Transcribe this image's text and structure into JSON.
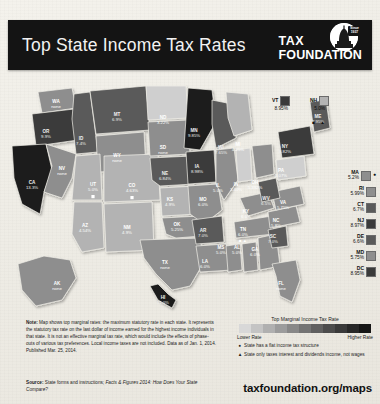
{
  "header": {
    "title": "Top State Income Tax Rates",
    "logo_line1": "TAX",
    "logo_line2": "FOUNDATION",
    "logo_seal_line1": "Since",
    "logo_seal_line2": "1937"
  },
  "chart_data": {
    "type": "heatmap",
    "title": "Top State Income Tax Rates",
    "legend_title": "Top Marginal Income Tax Rate",
    "legend_low": "Lower Rate",
    "legend_high": "Higher Rate",
    "categories": [
      "AL",
      "AK",
      "AZ",
      "AR",
      "CA",
      "CO",
      "CT",
      "DE",
      "DC",
      "FL",
      "GA",
      "HI",
      "ID",
      "IL",
      "IN",
      "IA",
      "KS",
      "KY",
      "LA",
      "ME",
      "MD",
      "MA",
      "MI",
      "MN",
      "MS",
      "MO",
      "MT",
      "NE",
      "NV",
      "NH",
      "NJ",
      "NM",
      "NY",
      "NC",
      "ND",
      "OH",
      "OK",
      "OR",
      "PA",
      "RI",
      "SC",
      "SD",
      "TN",
      "TX",
      "UT",
      "VT",
      "VA",
      "WA",
      "WV",
      "WI",
      "WY"
    ],
    "values": [
      5.0,
      0,
      4.54,
      7.0,
      13.3,
      4.63,
      6.7,
      6.6,
      8.95,
      0,
      6.0,
      11.0,
      7.4,
      5.0,
      3.4,
      8.98,
      4.9,
      6.0,
      6.0,
      7.95,
      5.75,
      5.2,
      4.25,
      9.85,
      5.0,
      6.0,
      6.9,
      6.84,
      0,
      5.0,
      8.97,
      4.9,
      8.82,
      5.8,
      3.22,
      5.392,
      5.25,
      9.9,
      3.07,
      5.99,
      7.0,
      0,
      6.0,
      0,
      5.0,
      8.95,
      5.75,
      0,
      6.5,
      7.65,
      0
    ],
    "states": [
      {
        "abbr": "WA",
        "rate": "none",
        "x": 56,
        "y": 29,
        "shade": "mid"
      },
      {
        "abbr": "OR",
        "rate": "9.9%",
        "x": 46,
        "y": 59,
        "shade": "vdark"
      },
      {
        "abbr": "CA",
        "rate": "13.3%",
        "x": 32,
        "y": 110,
        "shade": "black"
      },
      {
        "abbr": "ID",
        "rate": "7.4%",
        "x": 81,
        "y": 66,
        "shade": "dark"
      },
      {
        "abbr": "NV",
        "rate": "none",
        "x": 62,
        "y": 96,
        "shade": "mid"
      },
      {
        "abbr": "MT",
        "rate": "6.9%",
        "x": 117,
        "y": 42,
        "shade": "dark"
      },
      {
        "abbr": "WY",
        "rate": "none",
        "x": 117,
        "y": 83,
        "shade": "mid"
      },
      {
        "abbr": "UT",
        "rate": "5.0%",
        "x": 93,
        "y": 112,
        "shade": "light",
        "flat": true
      },
      {
        "abbr": "AZ",
        "rate": "4.54%",
        "x": 85,
        "y": 153,
        "shade": "light"
      },
      {
        "abbr": "CO",
        "rate": "4.63%",
        "x": 132,
        "y": 113,
        "shade": "light",
        "flat": true
      },
      {
        "abbr": "NM",
        "rate": "4.9%",
        "x": 127,
        "y": 155,
        "shade": "light"
      },
      {
        "abbr": "ND",
        "rate": "3.22%",
        "x": 163,
        "y": 45,
        "shade": "vlight"
      },
      {
        "abbr": "SD",
        "rate": "none",
        "x": 163,
        "y": 75,
        "shade": "mid"
      },
      {
        "abbr": "NE",
        "rate": "6.84%",
        "x": 165,
        "y": 101,
        "shade": "dark"
      },
      {
        "abbr": "KS",
        "rate": "4.9%",
        "x": 170,
        "y": 127,
        "shade": "light"
      },
      {
        "abbr": "OK",
        "rate": "5.25%",
        "x": 177,
        "y": 152,
        "shade": "mid"
      },
      {
        "abbr": "TX",
        "rate": "none",
        "x": 165,
        "y": 190,
        "shade": "mid"
      },
      {
        "abbr": "MN",
        "rate": "9.85%",
        "x": 194,
        "y": 58,
        "shade": "black"
      },
      {
        "abbr": "IA",
        "rate": "8.98%",
        "x": 197,
        "y": 94,
        "shade": "vdark"
      },
      {
        "abbr": "MO",
        "rate": "6.0%",
        "x": 203,
        "y": 127,
        "shade": "mid"
      },
      {
        "abbr": "AR",
        "rate": "7.0%",
        "x": 203,
        "y": 158,
        "shade": "dark"
      },
      {
        "abbr": "LA",
        "rate": "6.0%",
        "x": 205,
        "y": 189,
        "shade": "mid"
      },
      {
        "abbr": "WI",
        "rate": "7.65%",
        "x": 221,
        "y": 75,
        "shade": "dark"
      },
      {
        "abbr": "IL",
        "rate": "5.0%",
        "x": 218,
        "y": 113,
        "shade": "mid"
      },
      {
        "abbr": "MS",
        "rate": "5.0%",
        "x": 221,
        "y": 175,
        "shade": "mid"
      },
      {
        "abbr": "AL",
        "rate": "5.0%",
        "x": 237,
        "y": 175,
        "shade": "mid"
      },
      {
        "abbr": "MI",
        "rate": "4.25%",
        "x": 238,
        "y": 72,
        "shade": "light"
      },
      {
        "abbr": "IN",
        "rate": "3.40%",
        "x": 236,
        "y": 112,
        "shade": "vlight"
      },
      {
        "abbr": "OH",
        "rate": "5.392%",
        "x": 255,
        "y": 110,
        "shade": "mid"
      },
      {
        "abbr": "KY",
        "rate": "6.0%",
        "x": 246,
        "y": 139,
        "shade": "mid"
      },
      {
        "abbr": "TN",
        "rate": "6.0%",
        "x": 243,
        "y": 157,
        "shade": "mid",
        "interest": true
      },
      {
        "abbr": "GA",
        "rate": "6.0%",
        "x": 255,
        "y": 177,
        "shade": "mid"
      },
      {
        "abbr": "FL",
        "rate": "none",
        "x": 281,
        "y": 211,
        "shade": "mid"
      },
      {
        "abbr": "SC",
        "rate": "7.0%",
        "x": 273,
        "y": 164,
        "shade": "dark"
      },
      {
        "abbr": "NC",
        "rate": "5.8%",
        "x": 276,
        "y": 148,
        "shade": "mid"
      },
      {
        "abbr": "VA",
        "rate": "5.75%",
        "x": 283,
        "y": 130,
        "shade": "mid"
      },
      {
        "abbr": "WV",
        "rate": "6.5%",
        "x": 266,
        "y": 126,
        "shade": "dark"
      },
      {
        "abbr": "PA",
        "rate": "3.07%",
        "x": 281,
        "y": 98,
        "shade": "vlight"
      },
      {
        "abbr": "NY",
        "rate": "8.82%",
        "x": 285,
        "y": 74,
        "shade": "vdark"
      },
      {
        "abbr": "ME",
        "rate": "7.95%",
        "x": 318,
        "y": 44,
        "shade": "dark"
      },
      {
        "abbr": "AK",
        "rate": "none",
        "x": 57,
        "y": 211,
        "shade": "mid"
      },
      {
        "abbr": "HI",
        "rate": "11.0%",
        "x": 163,
        "y": 225,
        "shade": "black"
      }
    ],
    "top_states": [
      {
        "abbr": "VT",
        "rate": "8.95%",
        "shade": "vdark",
        "marks": ""
      },
      {
        "abbr": "NH",
        "rate": "5.0%",
        "shade": "light",
        "marks": "■ ▲"
      }
    ],
    "side_states": [
      {
        "abbr": "MA",
        "rate": "5.2%",
        "shade": "mid",
        "flat": true
      },
      {
        "abbr": "RI",
        "rate": "5.99%",
        "shade": "mid",
        "flat": false
      },
      {
        "abbr": "CT",
        "rate": "6.7%",
        "shade": "dark",
        "flat": false
      },
      {
        "abbr": "NJ",
        "rate": "8.97%",
        "shade": "vdark",
        "flat": false
      },
      {
        "abbr": "DE",
        "rate": "6.6%",
        "shade": "dark",
        "flat": false
      },
      {
        "abbr": "MD",
        "rate": "5.75%",
        "shade": "mid",
        "flat": false
      },
      {
        "abbr": "DC",
        "rate": "8.95%",
        "shade": "vdark",
        "flat": false
      }
    ],
    "ramp_colors": [
      "#d8d8d8",
      "#c4c4c4",
      "#b0b0b0",
      "#9c9c9c",
      "#888888",
      "#747474",
      "#606060",
      "#4c4c4c",
      "#3a3a3a",
      "#282828",
      "#161616"
    ]
  },
  "note": {
    "label": "Note:",
    "body": " Map shows top marginal rates: the maximum statutory rate in each state. It represents the statutory tax rate on the last dollar of income earned for the highest income individuals in that state. It is not an effective marginal tax rate, which would include the effects of phase-outs of various tax preferences. Local income taxes are not included. Data as of Jan. 1, 2014. Published Mar. 25, 2014."
  },
  "source": {
    "label": "Source:",
    "body": " State forms and instructions; ",
    "italic": "Facts & Figures 2014: How Does Your State Compare?"
  },
  "legend": {
    "title": "Top Marginal Income Tax Rate",
    "lower": "Lower Rate",
    "higher": "Higher Rate",
    "flat_glyph": "●",
    "flat_text": "State has a flat income tax structure",
    "interest_glyph": "▲",
    "interest_text": "State only taxes interest and dividends income, not wages"
  },
  "url": "taxfoundation.org/maps"
}
